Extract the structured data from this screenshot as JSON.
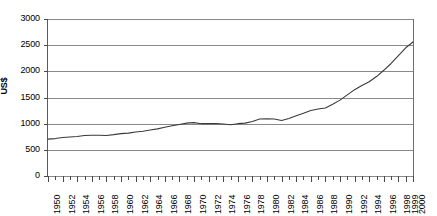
{
  "chart_data": {
    "type": "line",
    "title": "",
    "subtitle": "",
    "xlabel": "",
    "ylabel": "US$",
    "ylim": [
      0,
      3000
    ],
    "xlim": [
      1950,
      2000
    ],
    "ytick_step": 500,
    "ytick_labels": [
      "3000",
      "2500",
      "2000",
      "1500",
      "1000",
      "500",
      "0"
    ],
    "ytick_values": [
      3000,
      2500,
      2000,
      1500,
      1000,
      500,
      0
    ],
    "xtick_labels": [
      "1950",
      "1952",
      "1954",
      "1956",
      "1958",
      "1960",
      "1962",
      "1964",
      "1966",
      "1968",
      "1970",
      "1972",
      "1974",
      "1976",
      "1978",
      "1980",
      "1982",
      "1984",
      "1986",
      "1988",
      "1990",
      "1992",
      "1994",
      "1996",
      "1998",
      "1999",
      "2000"
    ],
    "xtick_values": [
      1950,
      1952,
      1954,
      1956,
      1958,
      1960,
      1962,
      1964,
      1966,
      1968,
      1970,
      1972,
      1974,
      1976,
      1978,
      1980,
      1982,
      1984,
      1986,
      1988,
      1990,
      1992,
      1994,
      1996,
      1998,
      1999,
      2000
    ],
    "grid": "horizontal",
    "legend": "none",
    "line_color": "#3a3a3a",
    "grid_color": "#8a8a8a",
    "axis_color": "#5a5a5a",
    "x": [
      1950,
      1951,
      1952,
      1953,
      1954,
      1955,
      1956,
      1957,
      1958,
      1959,
      1960,
      1961,
      1962,
      1963,
      1964,
      1965,
      1966,
      1967,
      1968,
      1969,
      1970,
      1971,
      1972,
      1973,
      1974,
      1975,
      1976,
      1977,
      1978,
      1979,
      1980,
      1981,
      1982,
      1983,
      1984,
      1985,
      1986,
      1987,
      1988,
      1989,
      1990,
      1991,
      1992,
      1993,
      1994,
      1995,
      1996,
      1997,
      1998,
      1999,
      2000
    ],
    "values": [
      705,
      715,
      735,
      745,
      755,
      775,
      780,
      780,
      775,
      790,
      810,
      820,
      840,
      855,
      880,
      900,
      930,
      960,
      985,
      1010,
      1020,
      1000,
      1000,
      1000,
      995,
      980,
      1000,
      1010,
      1040,
      1090,
      1095,
      1090,
      1060,
      1100,
      1150,
      1200,
      1250,
      1280,
      1300,
      1370,
      1450,
      1550,
      1650,
      1730,
      1800,
      1900,
      2020,
      2150,
      2300,
      2450,
      2560
    ],
    "series": [
      {
        "name": "US$",
        "values": [
          705,
          715,
          735,
          745,
          755,
          775,
          780,
          780,
          775,
          790,
          810,
          820,
          840,
          855,
          880,
          900,
          930,
          960,
          985,
          1010,
          1020,
          1000,
          1000,
          1000,
          995,
          980,
          1000,
          1010,
          1040,
          1090,
          1095,
          1090,
          1060,
          1100,
          1150,
          1200,
          1250,
          1280,
          1300,
          1370,
          1450,
          1550,
          1650,
          1730,
          1800,
          1900,
          2020,
          2150,
          2300,
          2450,
          2560
        ]
      }
    ]
  }
}
